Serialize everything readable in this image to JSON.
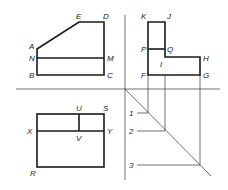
{
  "diagram": {
    "type": "orthographic-projection",
    "views": {
      "front": {
        "labels": {
          "A": "A",
          "N": "N",
          "B": "B",
          "C": "C",
          "M": "M",
          "D": "D",
          "E": "E"
        }
      },
      "side": {
        "labels": {
          "K": "K",
          "J": "J",
          "P": "P",
          "Q": "Q",
          "I": "I",
          "H": "H",
          "F": "F",
          "G": "G"
        }
      },
      "top": {
        "labels": {
          "U": "U",
          "S": "S",
          "X": "X",
          "Y": "Y",
          "V": "V",
          "R": "R"
        }
      },
      "miter": {
        "labels": {
          "p1": "1",
          "p2": "2",
          "p3": "3"
        }
      }
    },
    "colors": {
      "line": "#1a1a1a",
      "background": "#ffffff"
    }
  }
}
